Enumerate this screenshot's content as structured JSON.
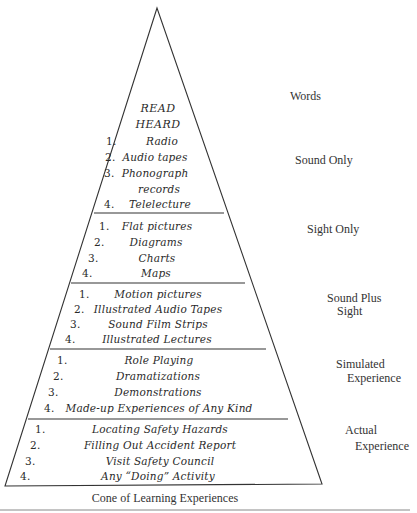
{
  "caption": "Cone of Learning Experiences",
  "colors": {
    "line": "#333333",
    "text": "#2a2a2a",
    "background": "#ffffff"
  },
  "cone": {
    "words": {
      "lines": [
        "READ",
        "HEARD"
      ]
    },
    "sound_only": {
      "items": [
        {
          "num": "1.",
          "text": "Radio"
        },
        {
          "num": "2.",
          "text": "Audio tapes"
        },
        {
          "num": "3.",
          "text": "Phonograph"
        },
        {
          "num": "",
          "text": "records"
        },
        {
          "num": "4.",
          "text": "Telelecture"
        }
      ]
    },
    "sight_only": {
      "items": [
        {
          "num": "1.",
          "text": "Flat pictures"
        },
        {
          "num": "2.",
          "text": "Diagrams"
        },
        {
          "num": "3.",
          "text": "Charts"
        },
        {
          "num": "4.",
          "text": "Maps"
        }
      ]
    },
    "sound_plus_sight": {
      "items": [
        {
          "num": "1.",
          "text": "Motion pictures"
        },
        {
          "num": "2.",
          "text": "Illustrated Audio Tapes"
        },
        {
          "num": "3.",
          "text": "Sound Film Strips"
        },
        {
          "num": "4.",
          "text": "Illustrated Lectures"
        }
      ]
    },
    "simulated": {
      "items": [
        {
          "num": "1.",
          "text": "Role Playing"
        },
        {
          "num": "2.",
          "text": "Dramatizations"
        },
        {
          "num": "3.",
          "text": "Demonstrations"
        },
        {
          "num": "4.",
          "text": "Made-up Experiences of Any Kind"
        }
      ]
    },
    "actual": {
      "items": [
        {
          "num": "1.",
          "text": "Locating Safety Hazards"
        },
        {
          "num": "2.",
          "text": "Filling Out Accident Report"
        },
        {
          "num": "3.",
          "text": "Visit Safety Council"
        },
        {
          "num": "4.",
          "text": "Any “Doing” Activity"
        }
      ]
    }
  },
  "categories": {
    "words": [
      "Words"
    ],
    "sound_only": [
      "Sound Only"
    ],
    "sight_only": [
      "Sight Only"
    ],
    "sound_plus_sight": [
      "Sound Plus",
      "Sight"
    ],
    "simulated": [
      "Simulated",
      "Experience"
    ],
    "actual": [
      "Actual",
      "Experience"
    ]
  }
}
